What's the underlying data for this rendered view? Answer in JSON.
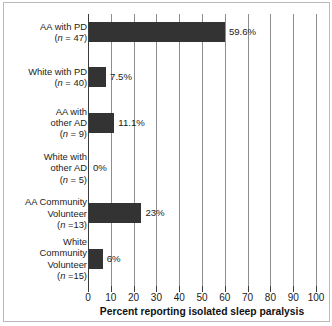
{
  "chart_data": {
    "type": "bar",
    "orientation": "horizontal",
    "title": "",
    "xlabel": "Percent reporting isolated sleep paralysis",
    "ylabel": "",
    "xlim": [
      0,
      100
    ],
    "xticks": [
      0,
      10,
      20,
      30,
      40,
      50,
      60,
      70,
      80,
      90,
      100
    ],
    "xtick_labels": [
      "0",
      "10",
      "20",
      "30",
      "40",
      "50",
      "60",
      "70",
      "80",
      "90",
      "100"
    ],
    "grid": "vertical",
    "legend": "none",
    "bar_color": "#333333",
    "categories": [
      "AA with PD (n = 47)",
      "White with PD (n = 40)",
      "AA with other AD (n = 9)",
      "White with other AD (n = 5)",
      "AA Community Volunteer (n =13)",
      "White Community Volunteer (n =15)"
    ],
    "values": [
      59.6,
      7.5,
      11.1,
      0,
      23,
      6
    ],
    "data_labels": [
      "59.6%",
      "7.5%",
      "11.1%",
      "0%",
      "23%",
      "6%"
    ],
    "bars": [
      {
        "name": "aa-with-pd",
        "label_lines": [
          "AA with PD",
          "(n = 47)"
        ],
        "n": 47,
        "value": 59.6,
        "data_label": "59.6%"
      },
      {
        "name": "white-with-pd",
        "label_lines": [
          "White with PD",
          "(n = 40)"
        ],
        "n": 40,
        "value": 7.5,
        "data_label": "7.5%"
      },
      {
        "name": "aa-with-other-ad",
        "label_lines": [
          "AA with",
          "other AD",
          "(n = 9)"
        ],
        "n": 9,
        "value": 11.1,
        "data_label": "11.1%"
      },
      {
        "name": "white-with-other-ad",
        "label_lines": [
          "White with",
          "other AD",
          "(n = 5)"
        ],
        "n": 5,
        "value": 0,
        "data_label": "0%"
      },
      {
        "name": "aa-community-volunteer",
        "label_lines": [
          "AA Community",
          "Volunteer",
          "(n =13)"
        ],
        "n": 13,
        "value": 23,
        "data_label": "23%"
      },
      {
        "name": "white-community-volunteer",
        "label_lines": [
          "White",
          "Community",
          "Volunteer",
          "(n =15)"
        ],
        "n": 15,
        "value": 6,
        "data_label": "6%"
      }
    ]
  }
}
